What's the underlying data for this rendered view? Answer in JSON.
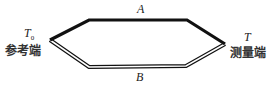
{
  "diagram": {
    "type": "thermocouple-loop",
    "wire_a": {
      "label": "A",
      "style": "thick-solid",
      "color": "#111111"
    },
    "wire_b": {
      "label": "B",
      "style": "double-line",
      "color": "#111111"
    },
    "reference_junction": {
      "symbol": "T",
      "subscript": "0",
      "label": "参考端"
    },
    "measuring_junction": {
      "symbol": "T",
      "label": "测量端"
    }
  }
}
